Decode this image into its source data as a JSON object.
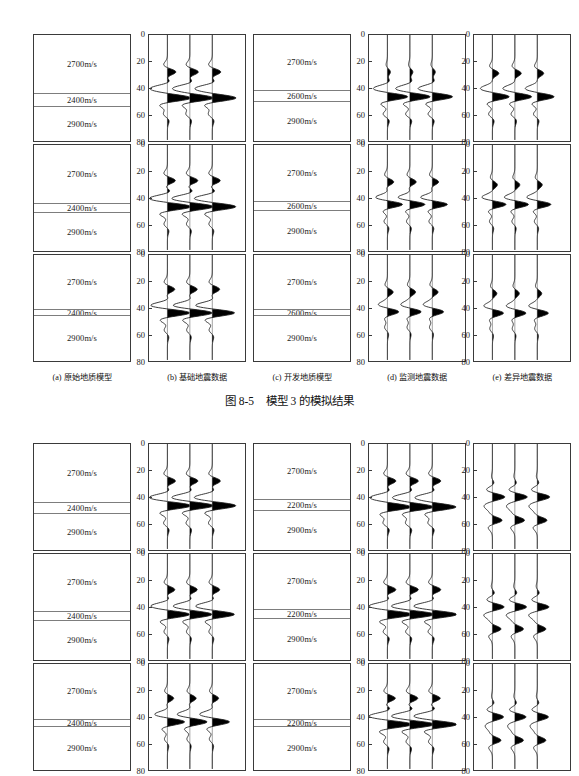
{
  "page": {
    "width": 579,
    "height": 764,
    "background": "#ffffff"
  },
  "axis": {
    "ticks": [
      "0",
      "20",
      "40",
      "60",
      "80"
    ],
    "range": [
      0,
      80
    ],
    "unit_implied": "ms",
    "tick_values": [
      0,
      20,
      40,
      60,
      80
    ]
  },
  "subcaptions": [
    {
      "key": "a",
      "label": "(a) 原始地质模型"
    },
    {
      "key": "b",
      "label": "(b) 基础地震数据"
    },
    {
      "key": "c",
      "label": "(c) 开发地质模型"
    },
    {
      "key": "d",
      "label": "(d) 监测地震数据"
    },
    {
      "key": "e",
      "label": "(e) 差异地震数据"
    }
  ],
  "caption": "图 8-5    模型 3 的模拟结果",
  "groups": [
    {
      "id": "group-top",
      "rows": [
        {
          "id": "top-row-1",
          "baseline_model": {
            "layers": [
              "2700m/s",
              "2400m/s",
              "2900m/s"
            ],
            "mid_top_pct": 55,
            "mid_height_pct": 13
          },
          "monitor_model": {
            "layers": [
              "2700m/s",
              "2600m/s",
              "2900m/s"
            ],
            "mid_top_pct": 52,
            "mid_height_pct": 11
          }
        },
        {
          "id": "top-row-2",
          "baseline_model": {
            "layers": [
              "2700m/s",
              "2400m/s",
              "2900m/s"
            ],
            "mid_top_pct": 55,
            "mid_height_pct": 9
          },
          "monitor_model": {
            "layers": [
              "2700m/s",
              "2600m/s",
              "2900m/s"
            ],
            "mid_top_pct": 53,
            "mid_height_pct": 9
          }
        },
        {
          "id": "top-row-3",
          "baseline_model": {
            "layers": [
              "2700m/s",
              "2400m/s",
              "2900m/s"
            ],
            "mid_top_pct": 51,
            "mid_height_pct": 7
          },
          "monitor_model": {
            "layers": [
              "2700m/s",
              "2600m/s",
              "2900m/s"
            ],
            "mid_top_pct": 51,
            "mid_height_pct": 7
          }
        }
      ]
    },
    {
      "id": "group-bottom",
      "rows": [
        {
          "id": "bot-row-1",
          "baseline_model": {
            "layers": [
              "2700m/s",
              "2400m/s",
              "2900m/s"
            ],
            "mid_top_pct": 55,
            "mid_height_pct": 11
          },
          "monitor_model": {
            "layers": [
              "2700m/s",
              "2200m/s",
              "2900m/s"
            ],
            "mid_top_pct": 52,
            "mid_height_pct": 11
          }
        },
        {
          "id": "bot-row-2",
          "baseline_model": {
            "layers": [
              "2700m/s",
              "2400m/s",
              "2900m/s"
            ],
            "mid_top_pct": 54,
            "mid_height_pct": 9
          },
          "monitor_model": {
            "layers": [
              "2700m/s",
              "2200m/s",
              "2900m/s"
            ],
            "mid_top_pct": 52,
            "mid_height_pct": 9
          }
        },
        {
          "id": "bot-row-3",
          "baseline_model": {
            "layers": [
              "2700m/s",
              "2400m/s",
              "2900m/s"
            ],
            "mid_top_pct": 52,
            "mid_height_pct": 7
          },
          "monitor_model": {
            "layers": [
              "2700m/s",
              "2200m/s",
              "2900m/s"
            ],
            "mid_top_pct": 52,
            "mid_height_pct": 7
          }
        }
      ]
    }
  ],
  "chart_data": {
    "type": "line",
    "title": "图 8-5    模型 3 的模拟结果",
    "xlabel": "",
    "ylabel": "",
    "ylim": [
      0,
      80
    ],
    "y_ticks": [
      0,
      20,
      40,
      60,
      80
    ],
    "grid": false,
    "legend": "none",
    "traces_per_panel": 3,
    "panels": [
      {
        "group": "group-top",
        "row": 1,
        "panel": "b",
        "label": "(b) 基础地震数据",
        "events": [
          {
            "center": 28,
            "polarity": "positive",
            "amplitude": 0.4
          },
          {
            "center": 40,
            "polarity": "negative",
            "amplitude": 0.55
          },
          {
            "center": 48,
            "polarity": "positive",
            "amplitude": 1.0
          },
          {
            "center": 60,
            "polarity": "negative",
            "amplitude": 0.18
          }
        ]
      },
      {
        "group": "group-top",
        "row": 1,
        "panel": "d",
        "label": "(d) 监测地震数据",
        "events": [
          {
            "center": 28,
            "polarity": "positive",
            "amplitude": 0.14
          },
          {
            "center": 40,
            "polarity": "negative",
            "amplitude": 0.35
          },
          {
            "center": 47,
            "polarity": "positive",
            "amplitude": 0.85
          },
          {
            "center": 60,
            "polarity": "negative",
            "amplitude": 0.2
          }
        ]
      },
      {
        "group": "group-top",
        "row": 1,
        "panel": "e",
        "label": "(e) 差异地震数据",
        "events": [
          {
            "center": 29,
            "polarity": "positive",
            "amplitude": 0.3
          },
          {
            "center": 40,
            "polarity": "negative",
            "amplitude": 0.3
          },
          {
            "center": 47,
            "polarity": "positive",
            "amplitude": 0.7
          },
          {
            "center": 60,
            "polarity": "negative",
            "amplitude": 0.18
          }
        ]
      },
      {
        "group": "group-top",
        "row": 2,
        "panel": "b",
        "label": "(b) 基础地震数据",
        "events": [
          {
            "center": 27,
            "polarity": "positive",
            "amplitude": 0.38
          },
          {
            "center": 40,
            "polarity": "negative",
            "amplitude": 0.5
          },
          {
            "center": 47,
            "polarity": "positive",
            "amplitude": 0.95
          },
          {
            "center": 60,
            "polarity": "negative",
            "amplitude": 0.16
          }
        ]
      },
      {
        "group": "group-top",
        "row": 2,
        "panel": "d",
        "label": "(d) 监测地震数据",
        "events": [
          {
            "center": 28,
            "polarity": "positive",
            "amplitude": 0.3
          },
          {
            "center": 40,
            "polarity": "negative",
            "amplitude": 0.3
          },
          {
            "center": 45,
            "polarity": "positive",
            "amplitude": 0.6
          },
          {
            "center": 58,
            "polarity": "negative",
            "amplitude": 0.16
          }
        ]
      },
      {
        "group": "group-top",
        "row": 2,
        "panel": "e",
        "label": "(e) 差异地震数据",
        "events": [
          {
            "center": 30,
            "polarity": "positive",
            "amplitude": 0.22
          },
          {
            "center": 40,
            "polarity": "negative",
            "amplitude": 0.25
          },
          {
            "center": 45,
            "polarity": "positive",
            "amplitude": 0.55
          },
          {
            "center": 58,
            "polarity": "negative",
            "amplitude": 0.14
          }
        ]
      },
      {
        "group": "group-top",
        "row": 3,
        "panel": "b",
        "label": "(b) 基础地震数据",
        "events": [
          {
            "center": 26,
            "polarity": "positive",
            "amplitude": 0.35
          },
          {
            "center": 38,
            "polarity": "negative",
            "amplitude": 0.4
          },
          {
            "center": 44,
            "polarity": "positive",
            "amplitude": 0.9
          },
          {
            "center": 57,
            "polarity": "negative",
            "amplitude": 0.15
          }
        ]
      },
      {
        "group": "group-top",
        "row": 3,
        "panel": "d",
        "label": "(d) 监测地震数据",
        "events": [
          {
            "center": 28,
            "polarity": "positive",
            "amplitude": 0.26
          },
          {
            "center": 38,
            "polarity": "negative",
            "amplitude": 0.22
          },
          {
            "center": 43,
            "polarity": "positive",
            "amplitude": 0.45
          },
          {
            "center": 55,
            "polarity": "negative",
            "amplitude": 0.13
          }
        ]
      },
      {
        "group": "group-top",
        "row": 3,
        "panel": "e",
        "label": "(e) 差异地震数据",
        "events": [
          {
            "center": 29,
            "polarity": "positive",
            "amplitude": 0.2
          },
          {
            "center": 39,
            "polarity": "negative",
            "amplitude": 0.2
          },
          {
            "center": 44,
            "polarity": "positive",
            "amplitude": 0.45
          },
          {
            "center": 56,
            "polarity": "negative",
            "amplitude": 0.12
          }
        ]
      },
      {
        "group": "group-bottom",
        "row": 1,
        "panel": "b",
        "label": "(b) 基础地震数据",
        "events": [
          {
            "center": 28,
            "polarity": "positive",
            "amplitude": 0.38
          },
          {
            "center": 40,
            "polarity": "negative",
            "amplitude": 0.5
          },
          {
            "center": 47,
            "polarity": "positive",
            "amplitude": 0.95
          },
          {
            "center": 60,
            "polarity": "negative",
            "amplitude": 0.18
          }
        ]
      },
      {
        "group": "group-bottom",
        "row": 1,
        "panel": "d",
        "label": "(d) 监测地震数据",
        "events": [
          {
            "center": 28,
            "polarity": "positive",
            "amplitude": 0.4
          },
          {
            "center": 40,
            "polarity": "negative",
            "amplitude": 0.55
          },
          {
            "center": 48,
            "polarity": "positive",
            "amplitude": 1.0
          },
          {
            "center": 60,
            "polarity": "negative",
            "amplitude": 0.2
          }
        ]
      },
      {
        "group": "group-bottom",
        "row": 1,
        "panel": "e",
        "label": "(e) 差异地震数据",
        "events": [
          {
            "center": 30,
            "polarity": "positive",
            "amplitude": 0.1
          },
          {
            "center": 40,
            "polarity": "positive",
            "amplitude": 0.55
          },
          {
            "center": 48,
            "polarity": "negative",
            "amplitude": 0.22
          },
          {
            "center": 58,
            "polarity": "positive",
            "amplitude": 0.45
          }
        ]
      },
      {
        "group": "group-bottom",
        "row": 2,
        "panel": "b",
        "label": "(b) 基础地震数据",
        "events": [
          {
            "center": 27,
            "polarity": "positive",
            "amplitude": 0.35
          },
          {
            "center": 39,
            "polarity": "negative",
            "amplitude": 0.45
          },
          {
            "center": 46,
            "polarity": "positive",
            "amplitude": 0.9
          },
          {
            "center": 59,
            "polarity": "negative",
            "amplitude": 0.16
          }
        ]
      },
      {
        "group": "group-bottom",
        "row": 2,
        "panel": "d",
        "label": "(d) 监测地震数据",
        "events": [
          {
            "center": 27,
            "polarity": "positive",
            "amplitude": 0.4
          },
          {
            "center": 39,
            "polarity": "negative",
            "amplitude": 0.5
          },
          {
            "center": 46,
            "polarity": "positive",
            "amplitude": 1.0
          },
          {
            "center": 59,
            "polarity": "negative",
            "amplitude": 0.2
          }
        ]
      },
      {
        "group": "group-bottom",
        "row": 2,
        "panel": "e",
        "label": "(e) 差异地震数据",
        "events": [
          {
            "center": 30,
            "polarity": "positive",
            "amplitude": 0.12
          },
          {
            "center": 40,
            "polarity": "positive",
            "amplitude": 0.5
          },
          {
            "center": 47,
            "polarity": "negative",
            "amplitude": 0.2
          },
          {
            "center": 57,
            "polarity": "positive",
            "amplitude": 0.4
          }
        ]
      },
      {
        "group": "group-bottom",
        "row": 3,
        "panel": "b",
        "label": "(b) 基础地震数据",
        "events": [
          {
            "center": 26,
            "polarity": "positive",
            "amplitude": 0.3
          },
          {
            "center": 38,
            "polarity": "negative",
            "amplitude": 0.3
          },
          {
            "center": 44,
            "polarity": "positive",
            "amplitude": 0.7
          },
          {
            "center": 57,
            "polarity": "negative",
            "amplitude": 0.14
          }
        ]
      },
      {
        "group": "group-bottom",
        "row": 3,
        "panel": "d",
        "label": "(d) 监测地震数据",
        "events": [
          {
            "center": 26,
            "polarity": "positive",
            "amplitude": 0.38
          },
          {
            "center": 39,
            "polarity": "negative",
            "amplitude": 0.5
          },
          {
            "center": 46,
            "polarity": "positive",
            "amplitude": 1.0
          },
          {
            "center": 59,
            "polarity": "negative",
            "amplitude": 0.18
          }
        ]
      },
      {
        "group": "group-bottom",
        "row": 3,
        "panel": "e",
        "label": "(e) 差异地震数据",
        "events": [
          {
            "center": 30,
            "polarity": "positive",
            "amplitude": 0.1
          },
          {
            "center": 40,
            "polarity": "positive",
            "amplitude": 0.5
          },
          {
            "center": 48,
            "polarity": "negative",
            "amplitude": 0.18
          },
          {
            "center": 58,
            "polarity": "positive",
            "amplitude": 0.4
          }
        ]
      }
    ]
  }
}
